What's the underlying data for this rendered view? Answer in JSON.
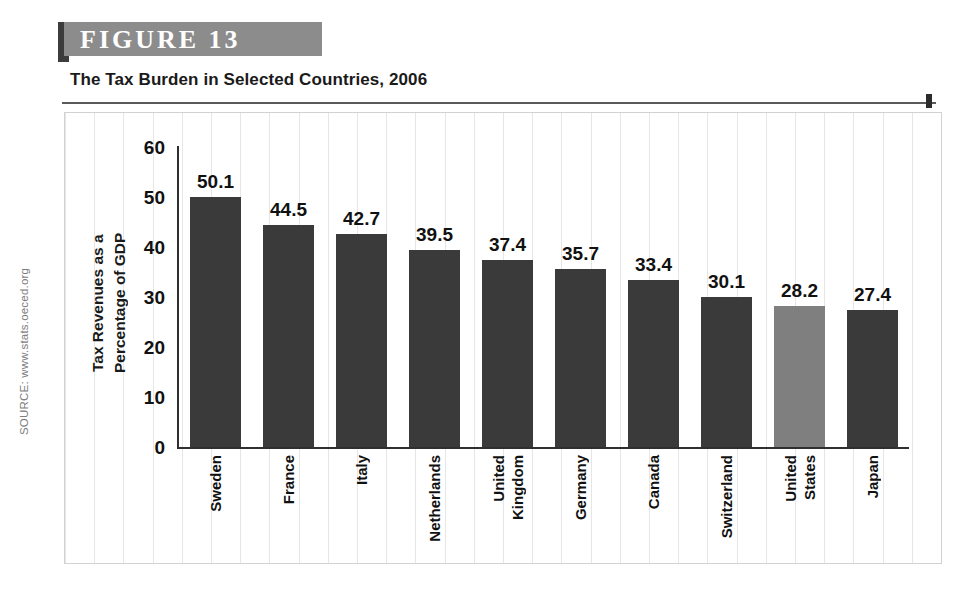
{
  "figure": {
    "banner_label": "FIGURE 13",
    "subtitle": "The Tax Burden in Selected Countries, 2006",
    "source": "SOURCE: www.stats.oeced.org"
  },
  "colors": {
    "bar": "#3a3a3a",
    "bar_highlight": "#7f7f7f",
    "banner_bg": "#8c8c8c",
    "banner_text": "#ffffff",
    "axis": "#2f2f2f",
    "grid": "#e6e6e6",
    "source_text": "#7d7d7d"
  },
  "chart_data": {
    "type": "bar",
    "title": "The Tax Burden in Selected Countries, 2006",
    "xlabel": "",
    "ylabel": "Tax Revenues as a Percentage of GDP",
    "ylabel_lines": [
      "Tax Revenues as a",
      "Percentage of GDP"
    ],
    "categories": [
      "Sweden",
      "France",
      "Italy",
      "Netherlands",
      "United Kingdom",
      "Germany",
      "Canada",
      "Switzerland",
      "United States",
      "Japan"
    ],
    "category_label_lines": [
      [
        "Sweden"
      ],
      [
        "France"
      ],
      [
        "Italy"
      ],
      [
        "Netherlands"
      ],
      [
        "United",
        "Kingdom"
      ],
      [
        "Germany"
      ],
      [
        "Canada"
      ],
      [
        "Switzerland"
      ],
      [
        "United",
        "States"
      ],
      [
        "Japan"
      ]
    ],
    "values": [
      50.1,
      44.5,
      42.7,
      39.5,
      37.4,
      35.7,
      33.4,
      30.1,
      28.2,
      27.4
    ],
    "value_labels": [
      "50.1",
      "44.5",
      "42.7",
      "39.5",
      "37.4",
      "35.7",
      "33.4",
      "30.1",
      "28.2",
      "27.4"
    ],
    "highlighted_index": 8,
    "ylim": [
      0,
      60
    ],
    "yticks": [
      60,
      50,
      40,
      30,
      20,
      10,
      0
    ],
    "ytick_labels": [
      "60",
      "50",
      "40",
      "30",
      "20",
      "10",
      "0"
    ],
    "grid": true,
    "legend": null
  }
}
